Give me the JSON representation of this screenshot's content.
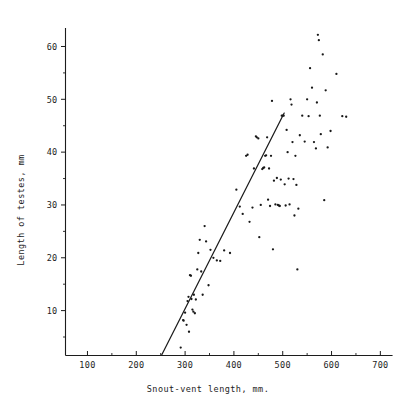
{
  "chart_data": {
    "type": "scatter",
    "title": "",
    "xlabel": "Snout-vent length, mm.",
    "ylabel": "Length of testes, mm",
    "xlim": [
      55,
      730
    ],
    "ylim": [
      1.5,
      63.5
    ],
    "xticks": [
      100,
      200,
      300,
      400,
      500,
      600,
      700
    ],
    "xtick_labels": [
      "100",
      "200",
      "300",
      "400",
      "500",
      "600",
      "700"
    ],
    "xminor_ticks": [
      150,
      250,
      350,
      450,
      550,
      650
    ],
    "yticks": [
      10,
      20,
      30,
      40,
      50,
      60
    ],
    "ytick_labels": [
      "10",
      "20",
      "30",
      "40",
      "50",
      "60"
    ],
    "yminor_ticks": [
      5,
      15,
      25,
      35,
      45,
      55
    ],
    "grid": false,
    "legend": null,
    "marker": "dot",
    "series": [
      {
        "name": "specimens",
        "points": [
          [
            291,
            3.0
          ],
          [
            296,
            8.2
          ],
          [
            297,
            8.1
          ],
          [
            300,
            9.6
          ],
          [
            303,
            7.3
          ],
          [
            305,
            11.8
          ],
          [
            307,
            12.6
          ],
          [
            308,
            6.0
          ],
          [
            310,
            16.7
          ],
          [
            312,
            16.6
          ],
          [
            313,
            12.2
          ],
          [
            315,
            10.2
          ],
          [
            317,
            9.8
          ],
          [
            318,
            13.0
          ],
          [
            320,
            9.5
          ],
          [
            322,
            12.1
          ],
          [
            325,
            17.8
          ],
          [
            327,
            20.9
          ],
          [
            330,
            23.4
          ],
          [
            333,
            17.4
          ],
          [
            336,
            13.0
          ],
          [
            340,
            26.0
          ],
          [
            343,
            23.1
          ],
          [
            348,
            14.8
          ],
          [
            352,
            21.5
          ],
          [
            358,
            20.0
          ],
          [
            365,
            19.5
          ],
          [
            372,
            19.4
          ],
          [
            380,
            21.4
          ],
          [
            392,
            20.9
          ],
          [
            405,
            32.9
          ],
          [
            412,
            29.7
          ],
          [
            418,
            28.3
          ],
          [
            425,
            39.3
          ],
          [
            428,
            39.5
          ],
          [
            432,
            26.8
          ],
          [
            438,
            29.5
          ],
          [
            441,
            36.9
          ],
          [
            445,
            43.0
          ],
          [
            447,
            42.8
          ],
          [
            450,
            42.6
          ],
          [
            452,
            23.9
          ],
          [
            455,
            30.0
          ],
          [
            458,
            36.8
          ],
          [
            460,
            37.0
          ],
          [
            462,
            37.1
          ],
          [
            464,
            39.3
          ],
          [
            466,
            39.4
          ],
          [
            468,
            42.8
          ],
          [
            470,
            31.0
          ],
          [
            472,
            36.9
          ],
          [
            474,
            29.8
          ],
          [
            476,
            39.3
          ],
          [
            478,
            49.7
          ],
          [
            480,
            21.6
          ],
          [
            482,
            34.6
          ],
          [
            485,
            30.1
          ],
          [
            488,
            35.1
          ],
          [
            490,
            30.0
          ],
          [
            492,
            29.9
          ],
          [
            494,
            29.8
          ],
          [
            496,
            34.8
          ],
          [
            498,
            46.9
          ],
          [
            500,
            46.9
          ],
          [
            502,
            46.9
          ],
          [
            504,
            33.9
          ],
          [
            506,
            29.9
          ],
          [
            508,
            44.2
          ],
          [
            510,
            40.0
          ],
          [
            512,
            35.0
          ],
          [
            514,
            30.1
          ],
          [
            516,
            50.0
          ],
          [
            518,
            49.0
          ],
          [
            520,
            41.9
          ],
          [
            522,
            34.9
          ],
          [
            524,
            28.0
          ],
          [
            526,
            39.3
          ],
          [
            528,
            33.8
          ],
          [
            530,
            17.8
          ],
          [
            532,
            29.3
          ],
          [
            535,
            43.2
          ],
          [
            540,
            46.9
          ],
          [
            545,
            42.0
          ],
          [
            550,
            50.0
          ],
          [
            553,
            46.8
          ],
          [
            556,
            55.9
          ],
          [
            560,
            52.2
          ],
          [
            564,
            41.9
          ],
          [
            568,
            40.7
          ],
          [
            570,
            49.4
          ],
          [
            572,
            62.2
          ],
          [
            574,
            61.2
          ],
          [
            576,
            46.9
          ],
          [
            578,
            43.4
          ],
          [
            582,
            58.5
          ],
          [
            585,
            30.9
          ],
          [
            588,
            51.7
          ],
          [
            592,
            40.9
          ],
          [
            598,
            44.0
          ],
          [
            610,
            54.8
          ],
          [
            622,
            46.8
          ],
          [
            630,
            46.7
          ]
        ]
      }
    ],
    "fit_line": {
      "name": "regression-line",
      "x_start": 252,
      "y_start": 1.6,
      "x_end": 503,
      "y_end": 47.4
    }
  },
  "figure": {
    "xlabel": "Snout-vent length, mm.",
    "ylabel": "Length of testes, mm"
  }
}
